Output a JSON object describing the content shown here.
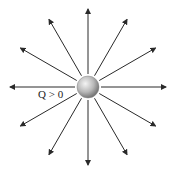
{
  "diagram": {
    "charge_label": "Q > 0",
    "center": [
      88,
      87
    ],
    "sphere_radius": 11,
    "arrow_count": 12,
    "arrow_length": 78,
    "line_color": "#2a2a2a",
    "sphere_colors": {
      "light": "#f2f2f2",
      "mid": "#b8b8b8",
      "dark": "#6e6e6e"
    }
  }
}
